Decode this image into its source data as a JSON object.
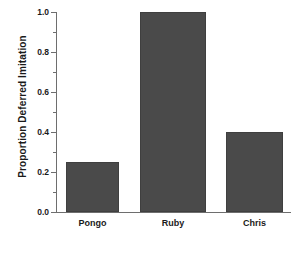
{
  "chart_data": {
    "type": "bar",
    "title": "",
    "xlabel": "",
    "ylabel": "Proportion Deferred Imitation",
    "categories": [
      "Pongo",
      "Ruby",
      "Chris"
    ],
    "values": [
      0.25,
      1.0,
      0.4
    ],
    "ylim": [
      0.0,
      1.0
    ],
    "ytick_labels": [
      "0.0",
      "0.2",
      "0.4",
      "0.6",
      "0.8",
      "1.0"
    ],
    "ytick_values": [
      0.0,
      0.2,
      0.4,
      0.6,
      0.8,
      1.0
    ],
    "yminor_tick_values": [
      0.1,
      0.3,
      0.5,
      0.7,
      0.9
    ],
    "grid": false,
    "legend": false,
    "bar_color": "#4a4a4a",
    "bar_edge_color": "#3f3f3f",
    "axis_color": "#6e6e6e",
    "background_color": "#ffffff",
    "text_color": "#1a1a1a",
    "bars": [
      {
        "category": "Pongo",
        "value": 0.25
      },
      {
        "category": "Ruby",
        "value": 1.0
      },
      {
        "category": "Chris",
        "value": 0.4
      }
    ]
  }
}
